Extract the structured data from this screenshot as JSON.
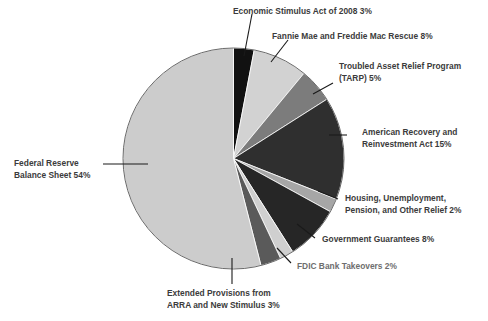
{
  "chart_data": {
    "type": "pie",
    "title": "",
    "subtitle": "",
    "xlabel": "",
    "ylabel": "",
    "legend_position": "callout-labels",
    "grid": false,
    "total_percent": 100,
    "categories": [
      "Economic Stimulus Act of 2008",
      "Fannie Mae and Freddie Mac Rescue",
      "Troubled Asset Relief Program (TARP)",
      "American Recovery and Reinvestment Act",
      "Housing, Unemployment, Pension, and Other Relief",
      "Government Guarantees",
      "FDIC Bank Takeovers",
      "Extended Provisions from ARRA and New Stimulus",
      "Federal Reserve Balance Sheet"
    ],
    "values": [
      3,
      8,
      5,
      15,
      2,
      8,
      2,
      3,
      54
    ],
    "colors": [
      "#111111",
      "#d2d2d2",
      "#7c7c7c",
      "#2f2f2f",
      "#a6a6a6",
      "#262626",
      "#cfcfcf",
      "#5a5a5a",
      "#cccccc"
    ],
    "slices": [
      {
        "label": "Economic Stimulus Act of 2008",
        "value": 3,
        "color": "#111111",
        "display": "Economic Stimulus Act of 2008 3%"
      },
      {
        "label": "Fannie Mae and Freddie Mac Rescue",
        "value": 8,
        "color": "#d2d2d2",
        "display": "Fannie Mae and Freddie Mac Rescue 8%"
      },
      {
        "label": "Troubled Asset Relief Program (TARP)",
        "value": 5,
        "color": "#7c7c7c",
        "display": "Troubled Asset Relief Program (TARP) 5%"
      },
      {
        "label": "American Recovery and Reinvestment Act",
        "value": 15,
        "color": "#2f2f2f",
        "display": "American Recovery and Reinvestment Act 15%"
      },
      {
        "label": "Housing, Unemployment, Pension, and Other Relief",
        "value": 2,
        "color": "#a6a6a6",
        "display": "Housing, Unemployment, Pension, and Other Relief 2%"
      },
      {
        "label": "Government Guarantees",
        "value": 8,
        "color": "#262626",
        "display": "Government Guarantees 8%"
      },
      {
        "label": "FDIC Bank Takeovers",
        "value": 2,
        "color": "#cfcfcf",
        "display": "FDIC Bank Takeovers 2%"
      },
      {
        "label": "Extended Provisions from ARRA and New Stimulus",
        "value": 3,
        "color": "#5a5a5a",
        "display": "Extended Provisions from ARRA and New Stimulus 3%"
      },
      {
        "label": "Federal Reserve Balance Sheet",
        "value": 54,
        "color": "#cccccc",
        "display": "Federal Reserve Balance Sheet 54%"
      }
    ]
  },
  "labels": {
    "economic_stimulus": {
      "line1": "Economic Stimulus Act of 2008 3%"
    },
    "fannie_freddie": {
      "line1": "Fannie Mae and Freddie Mac Rescue 8%"
    },
    "tarp": {
      "line1": "Troubled Asset Relief Program",
      "line2": "(TARP) 5%"
    },
    "arra": {
      "line1": "American Recovery and",
      "line2": "Reinvestment Act 15%"
    },
    "housing": {
      "line1": "Housing, Unemployment,",
      "line2": "Pension, and Other Relief 2%"
    },
    "gov_guarantees": {
      "line1": "Government Guarantees 8%"
    },
    "fdic": {
      "line1": "FDIC Bank Takeovers 2%"
    },
    "extended_provisions": {
      "line1": "Extended Provisions from",
      "line2": "ARRA and New Stimulus 3%"
    },
    "federal_reserve": {
      "line1": "Federal Reserve",
      "line2": "Balance Sheet 54%"
    }
  },
  "style": {
    "pie_outline": "#5a5a5a",
    "leader_line": "#1a1a1a",
    "text_color": "#3b3b3b",
    "background": "#ffffff"
  }
}
